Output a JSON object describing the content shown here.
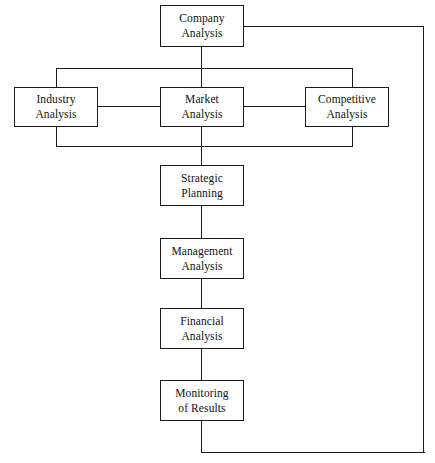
{
  "diagram": {
    "type": "flowchart",
    "line_color": "#1a1a1a",
    "box_fill": "#ffffff",
    "nodes": [
      {
        "id": "company",
        "label": "Company\nAnalysis",
        "x": 160,
        "y": 5,
        "w": 84,
        "h": 42
      },
      {
        "id": "industry",
        "label": "Industry\nAnalysis",
        "x": 14,
        "y": 87,
        "w": 84,
        "h": 40
      },
      {
        "id": "market",
        "label": "Market\nAnalysis",
        "x": 160,
        "y": 87,
        "w": 84,
        "h": 40
      },
      {
        "id": "competitive",
        "label": "Competitive\nAnalysis",
        "x": 305,
        "y": 87,
        "w": 84,
        "h": 40
      },
      {
        "id": "strategic",
        "label": "Strategic\nPlanning",
        "x": 160,
        "y": 165,
        "w": 84,
        "h": 41
      },
      {
        "id": "management",
        "label": "Management\nAnalysis",
        "x": 160,
        "y": 238,
        "w": 84,
        "h": 41
      },
      {
        "id": "financial",
        "label": "Financial\nAnalysis",
        "x": 160,
        "y": 308,
        "w": 84,
        "h": 41
      },
      {
        "id": "monitoring",
        "label": "Monitoring\nof Results",
        "x": 160,
        "y": 380,
        "w": 84,
        "h": 41
      }
    ],
    "edges": [
      {
        "id": "company-to-market",
        "orient": "v",
        "x": 201,
        "y": 47,
        "len": 40
      },
      {
        "id": "industry-to-market",
        "orient": "h",
        "x": 98,
        "y": 106,
        "len": 62
      },
      {
        "id": "market-to-competitive",
        "orient": "h",
        "x": 244,
        "y": 106,
        "len": 61
      },
      {
        "id": "bracket-top-line",
        "orient": "h",
        "x": 56,
        "y": 68,
        "len": 297
      },
      {
        "id": "bracket-top-left-stem",
        "orient": "v",
        "x": 56,
        "y": 68,
        "len": 19
      },
      {
        "id": "bracket-top-right-stem",
        "orient": "v",
        "x": 352,
        "y": 68,
        "len": 19
      },
      {
        "id": "bracket-bottom-line",
        "orient": "h",
        "x": 56,
        "y": 146,
        "len": 297
      },
      {
        "id": "bracket-bottom-left-stem",
        "orient": "v",
        "x": 56,
        "y": 127,
        "len": 19
      },
      {
        "id": "bracket-bottom-right-stem",
        "orient": "v",
        "x": 352,
        "y": 127,
        "len": 19
      },
      {
        "id": "market-to-strategic",
        "orient": "v",
        "x": 201,
        "y": 127,
        "len": 38
      },
      {
        "id": "strategic-to-management",
        "orient": "v",
        "x": 201,
        "y": 206,
        "len": 32
      },
      {
        "id": "management-to-financial",
        "orient": "v",
        "x": 201,
        "y": 279,
        "len": 29
      },
      {
        "id": "financial-to-monitoring",
        "orient": "v",
        "x": 201,
        "y": 349,
        "len": 31
      },
      {
        "id": "feedback-stem-down",
        "orient": "v",
        "x": 201,
        "y": 421,
        "len": 32
      },
      {
        "id": "feedback-bottom-run",
        "orient": "h",
        "x": 201,
        "y": 452,
        "len": 224
      },
      {
        "id": "feedback-right-riser",
        "orient": "v",
        "x": 423,
        "y": 26,
        "len": 427
      },
      {
        "id": "feedback-top-run",
        "orient": "h",
        "x": 244,
        "y": 26,
        "len": 180
      }
    ]
  }
}
